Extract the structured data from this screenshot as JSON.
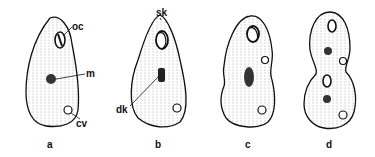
{
  "figure": {
    "panels": [
      {
        "id": "a",
        "caption": "a",
        "labels": [
          "oc",
          "m",
          "cv"
        ]
      },
      {
        "id": "b",
        "caption": "b",
        "labels": [
          "sk",
          "dk"
        ]
      },
      {
        "id": "c",
        "caption": "c",
        "labels": []
      },
      {
        "id": "d",
        "caption": "d",
        "labels": []
      }
    ],
    "annotations": {
      "oc": "oc",
      "m": "m",
      "cv": "cv",
      "sk": "sk",
      "dk": "dk"
    },
    "colors": {
      "ink": "#111111",
      "background": "#ffffff"
    }
  }
}
